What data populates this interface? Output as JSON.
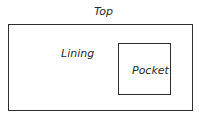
{
  "diagram": {
    "title_label": "Top",
    "outer_region_label": "Lining",
    "inner_region_label": "Pocket",
    "colors": {
      "stroke": "#2e2e2e",
      "text": "#2b2b2b",
      "background": "#ffffff"
    }
  }
}
